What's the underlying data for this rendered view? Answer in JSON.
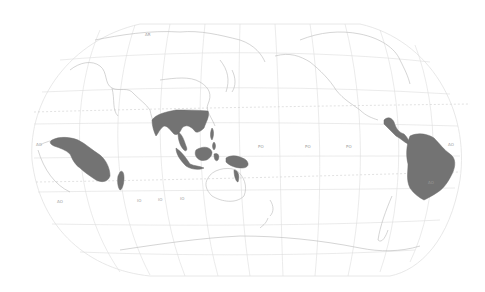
{
  "map": {
    "projection": "pacific-centered-world",
    "background": "#ffffff",
    "graticule_color": "#dcdcdc",
    "coastline_color": "#b4b4b4",
    "highlight_color": "#737373",
    "highlighted_regions": [
      {
        "name": "tropical-africa"
      },
      {
        "name": "madagascar"
      },
      {
        "name": "southeast-asia-and-new-guinea"
      },
      {
        "name": "central-and-south-america"
      }
    ],
    "labels": [
      "AS",
      "EU",
      "NA",
      "AF",
      "SA",
      "IO",
      "PO",
      "AO",
      "AU",
      "OC",
      "AN"
    ]
  }
}
